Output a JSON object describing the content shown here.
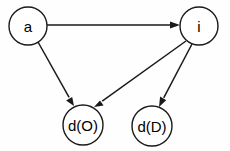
{
  "diagram": {
    "type": "directed-graph",
    "title": "",
    "background_color": "#fefefe",
    "stroke_color": "#1a1a1a",
    "fill_color": "#ffffff",
    "width": 230,
    "height": 151,
    "nodes": [
      {
        "id": "a",
        "label": "a",
        "cx": 28,
        "cy": 26,
        "r": 19
      },
      {
        "id": "i",
        "label": "i",
        "cx": 199,
        "cy": 26,
        "r": 19
      },
      {
        "id": "dO",
        "label": "d(O)",
        "cx": 83,
        "cy": 125,
        "r": 20
      },
      {
        "id": "dD",
        "label": "d(D)",
        "cx": 152,
        "cy": 126,
        "r": 20
      }
    ],
    "edges": [
      {
        "id": "a-to-i",
        "from": "a",
        "to": "i",
        "label": "",
        "x1": 47,
        "y1": 25,
        "x2": 180,
        "y2": 25
      },
      {
        "id": "a-to-dO",
        "from": "a",
        "to": "dO",
        "label": "",
        "x1": 38,
        "y1": 42,
        "x2": 74,
        "y2": 106
      },
      {
        "id": "i-to-dO",
        "from": "i",
        "to": "dO",
        "label": "",
        "x1": 186,
        "y1": 41,
        "x2": 94,
        "y2": 107
      },
      {
        "id": "i-to-dD",
        "from": "i",
        "to": "dD",
        "label": "",
        "x1": 192,
        "y1": 44,
        "x2": 159,
        "y2": 107
      }
    ],
    "arrowhead": {
      "length": 10,
      "width": 7
    }
  }
}
